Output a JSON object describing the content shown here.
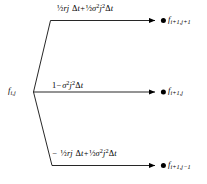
{
  "figure": {
    "type": "trinomial-branch-diagram",
    "background_color": "#ffffff",
    "line_color": "#000000"
  },
  "source_node": {
    "symbol": "f",
    "sub_time": "i",
    "sub_space": "j",
    "label_plain": "f i,j"
  },
  "branches": [
    {
      "id": "up",
      "direction": "up",
      "probability_plain": "½rj Δt + ½σ²j²Δt",
      "terms": [
        {
          "sign": "",
          "coef": "½",
          "body": "rj",
          "time": "Δt"
        },
        {
          "sign": "+",
          "coef": "½",
          "body": "σ²j²",
          "time": "Δt"
        }
      ],
      "target_node": {
        "symbol": "f",
        "sub_time": "i+1",
        "sub_space": "j+1",
        "label_plain": "f i+1,j+1"
      }
    },
    {
      "id": "middle",
      "direction": "horizontal",
      "probability_plain": "1 − σ²j²Δt",
      "terms": [
        {
          "sign": "",
          "coef": "1",
          "body": "",
          "time": ""
        },
        {
          "sign": "−",
          "coef": "",
          "body": "σ²j²",
          "time": "Δt"
        }
      ],
      "target_node": {
        "symbol": "f",
        "sub_time": "i+1",
        "sub_space": "j",
        "label_plain": "f i+1,j"
      }
    },
    {
      "id": "down",
      "direction": "down",
      "probability_plain": "− ½rj Δt + ½σ²j²Δt",
      "terms": [
        {
          "sign": "−",
          "coef": "½",
          "body": "rj",
          "time": "Δt"
        },
        {
          "sign": "+",
          "coef": "½",
          "body": "σ²j²",
          "time": "Δt"
        }
      ],
      "target_node": {
        "symbol": "f",
        "sub_time": "i+1",
        "sub_space": "j−1",
        "label_plain": "f i+1,j−1"
      }
    }
  ],
  "glyphs": {
    "half": "½",
    "sigma": "σ",
    "delta": "Δ",
    "minus": "−",
    "plus": "+",
    "sq": "2",
    "r": "r",
    "j": "j",
    "one": "1",
    "f": "f",
    "i_plus_1": "i+1",
    "j_plus_1": "j+1",
    "j_minus_1": "j−1",
    "i": "i"
  }
}
